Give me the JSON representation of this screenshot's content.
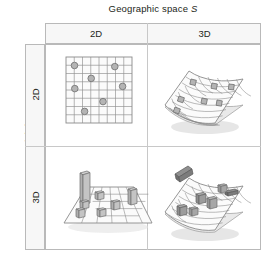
{
  "figure": {
    "type": "2x2-conceptual-matrix",
    "column_axis": {
      "title_text": "Geographic space ",
      "title_symbol": "S",
      "headers": [
        "2D",
        "3D"
      ]
    },
    "row_axis": {
      "title_text": "Geo-spatial data ",
      "title_symbol": "A",
      "headers": [
        "2D",
        "3D"
      ]
    },
    "cells": [
      {
        "id": "cell-2d-2d",
        "row": "2D",
        "column": "2D",
        "illustration": "flat-square-grid-with-point-markers",
        "marker_count": 6,
        "marker_shape": "circle"
      },
      {
        "id": "cell-2d-3d",
        "row": "2D",
        "column": "3D",
        "illustration": "curved-3d-surface-with-flat-point-markers",
        "marker_count": 6,
        "marker_shape": "flat-square"
      },
      {
        "id": "cell-3d-2d",
        "row": "3D",
        "column": "2D",
        "illustration": "flat-perspective-plane-with-3d-box-objects",
        "marker_count": 7,
        "marker_shape": "extruded-box"
      },
      {
        "id": "cell-3d-3d",
        "row": "3D",
        "column": "3D",
        "illustration": "curved-3d-surface-with-3d-box-objects",
        "marker_count": 6,
        "marker_shape": "extruded-box"
      }
    ],
    "colors": {
      "frame": "#b9b9b9",
      "divider": "#c8c8c8",
      "header_fill": "#f7f7f7",
      "grid_line": "#8a8a8a",
      "surface_fill": "#fbfbfb",
      "marker_fill": "#b4b4b4",
      "marker_stroke": "#6f6f6f",
      "shadow": "#d8d8d8",
      "text": "#231f20"
    }
  }
}
